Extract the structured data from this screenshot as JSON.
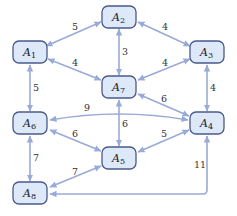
{
  "colors": {
    "node_fill": "#dde8f8",
    "node_stroke": "#4a5a8a",
    "edge": "#9aaad8",
    "label": "#333333"
  },
  "nodes": [
    {
      "id": "A1",
      "letter": "A",
      "sub": "1",
      "x": 30,
      "y": 52
    },
    {
      "id": "A2",
      "letter": "A",
      "sub": "2",
      "x": 119,
      "y": 17
    },
    {
      "id": "A3",
      "letter": "A",
      "sub": "3",
      "x": 207,
      "y": 52
    },
    {
      "id": "A4",
      "letter": "A",
      "sub": "4",
      "x": 207,
      "y": 123
    },
    {
      "id": "A5",
      "letter": "A",
      "sub": "5",
      "x": 119,
      "y": 158
    },
    {
      "id": "A6",
      "letter": "A",
      "sub": "6",
      "x": 30,
      "y": 123
    },
    {
      "id": "A7",
      "letter": "A",
      "sub": "7",
      "x": 119,
      "y": 87
    },
    {
      "id": "A8",
      "letter": "A",
      "sub": "8",
      "x": 30,
      "y": 193
    }
  ],
  "edges": [
    {
      "from": "A1",
      "to": "A2",
      "weight": "5",
      "bidirectional": true
    },
    {
      "from": "A2",
      "to": "A3",
      "weight": "4",
      "bidirectional": true
    },
    {
      "from": "A2",
      "to": "A7",
      "weight": "3",
      "bidirectional": true
    },
    {
      "from": "A1",
      "to": "A7",
      "weight": "4",
      "bidirectional": true
    },
    {
      "from": "A3",
      "to": "A7",
      "weight": "4",
      "bidirectional": true
    },
    {
      "from": "A1",
      "to": "A6",
      "weight": "5",
      "bidirectional": true
    },
    {
      "from": "A3",
      "to": "A4",
      "weight": "4",
      "bidirectional": true
    },
    {
      "from": "A7",
      "to": "A4",
      "weight": "6",
      "bidirectional": true
    },
    {
      "from": "A6",
      "to": "A4",
      "weight": "9",
      "bidirectional": true
    },
    {
      "from": "A7",
      "to": "A5",
      "weight": "6",
      "bidirectional": true
    },
    {
      "from": "A6",
      "to": "A5",
      "weight": "6",
      "bidirectional": true
    },
    {
      "from": "A5",
      "to": "A4",
      "weight": "5",
      "bidirectional": true
    },
    {
      "from": "A6",
      "to": "A8",
      "weight": "7",
      "bidirectional": true
    },
    {
      "from": "A8",
      "to": "A5",
      "weight": "7",
      "bidirectional": true
    },
    {
      "from": "A8",
      "to": "A4",
      "weight": "11",
      "bidirectional": true
    }
  ],
  "labels": {
    "e_A1_A2": "5",
    "e_A2_A3": "4",
    "e_A2_A7": "3",
    "e_A1_A7": "4",
    "e_A3_A7": "4",
    "e_A1_A6": "5",
    "e_A3_A4": "4",
    "e_A7_A4": "6",
    "e_A6_A4": "9",
    "e_A7_A5": "6",
    "e_A6_A5": "6",
    "e_A5_A4": "5",
    "e_A6_A8": "7",
    "e_A8_A5": "7",
    "e_A8_A4": "11"
  },
  "node_text": {
    "A1": {
      "letter": "A",
      "sub": "1"
    },
    "A2": {
      "letter": "A",
      "sub": "2"
    },
    "A3": {
      "letter": "A",
      "sub": "3"
    },
    "A4": {
      "letter": "A",
      "sub": "4"
    },
    "A5": {
      "letter": "A",
      "sub": "5"
    },
    "A6": {
      "letter": "A",
      "sub": "6"
    },
    "A7": {
      "letter": "A",
      "sub": "7"
    },
    "A8": {
      "letter": "A",
      "sub": "8"
    }
  }
}
